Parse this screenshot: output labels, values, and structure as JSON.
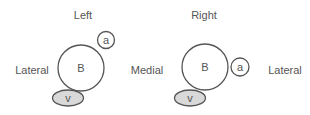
{
  "panels": [
    {
      "title": "Left",
      "side_labels": {
        "left": "Lateral",
        "right": ""
      },
      "circle_b": "B",
      "circle_a": "a",
      "ellipse_v": "v"
    },
    {
      "title": "Right",
      "side_labels": {
        "left": "Medial",
        "right": "Lateral"
      },
      "circle_b": "B",
      "circle_a": "a",
      "ellipse_v": "v"
    }
  ],
  "colors": {
    "stroke": "#555555",
    "text": "#555555",
    "v_fill": "#d9d9d9",
    "background": "#ffffff"
  }
}
